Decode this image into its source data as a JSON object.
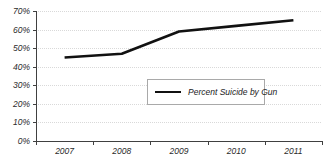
{
  "chart_data": {
    "type": "line",
    "title": "",
    "subtitle": "",
    "xlabel": "",
    "ylabel": "",
    "categories": [
      "2007",
      "2008",
      "2009",
      "2010",
      "2011"
    ],
    "series": [
      {
        "name": "Percent Suicide by Gun",
        "values": [
          45,
          47,
          59,
          62,
          65
        ],
        "color": "#111111"
      }
    ],
    "ylim": [
      0,
      70
    ],
    "ytick_labels": [
      "0%",
      "10%",
      "20%",
      "30%",
      "40%",
      "50%",
      "60%",
      "70%"
    ],
    "ytick_values": [
      0,
      10,
      20,
      30,
      40,
      50,
      60,
      70
    ],
    "grid": true,
    "grid_color": "#d9d9d9",
    "axis_color": "#404040",
    "legend_position": "center",
    "background": "#ffffff"
  },
  "legend": {
    "entries": [
      {
        "label": "Percent Suicide by Gun"
      }
    ]
  }
}
